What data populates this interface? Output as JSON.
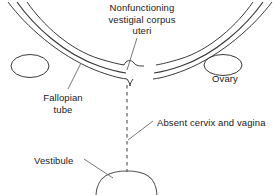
{
  "figure": {
    "background_color": "#ffffff",
    "line_color": "#3a3a3a",
    "text_color": "#1a1a1a",
    "dashed_color": "#777777"
  },
  "labels": {
    "vestigial_uteri": "Nonfunctioning\nvestigial corpus\nuteri",
    "fallopian_tube": "Fallopian\ntube",
    "ovary": "Ovary",
    "absent_cervix_vagina": "Absent cervix and vagina",
    "vestibule": "Vestibule"
  },
  "structures": [
    {
      "name": "left-fallopian-tube",
      "type": "curve-group",
      "strokes": 3
    },
    {
      "name": "right-fallopian-tube",
      "type": "curve-group",
      "strokes": 3
    },
    {
      "name": "left-ovary",
      "type": "ellipse"
    },
    {
      "name": "right-ovary",
      "type": "ellipse"
    },
    {
      "name": "vestigial-corpus-uteri",
      "type": "bump"
    },
    {
      "name": "absent-cervix-vagina-tract",
      "type": "dashed-line"
    },
    {
      "name": "vestibule-arc",
      "type": "arc"
    }
  ]
}
